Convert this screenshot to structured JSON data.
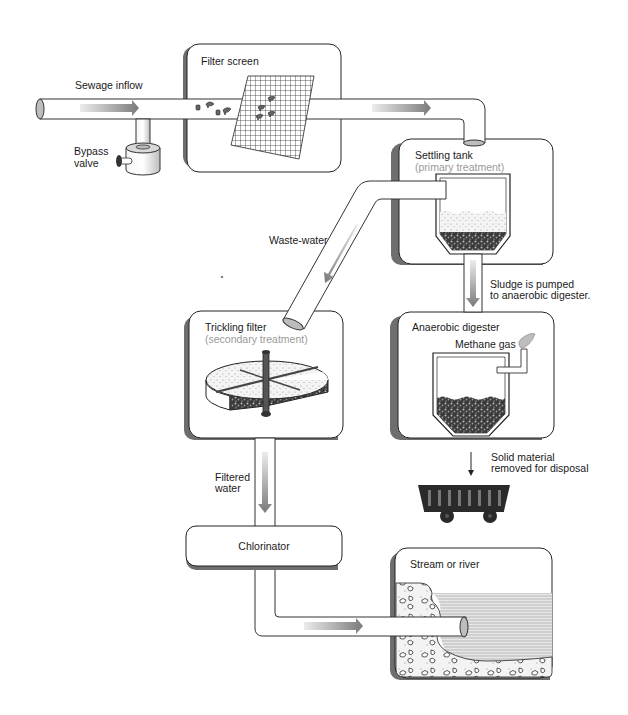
{
  "labels": {
    "sewage_inflow": "Sewage inflow",
    "bypass_valve_line1": "Bypass",
    "bypass_valve_line2": "valve",
    "filter_screen": "Filter screen",
    "settling_tank": "Settling tank",
    "settling_tank_sub": "(primary treatment)",
    "waste_water": "Waste-water",
    "sludge_line1": "Sludge is pumped",
    "sludge_line2": "to anaerobic digester.",
    "trickling_filter": "Trickling filter",
    "trickling_filter_sub": "(secondary treatment)",
    "anaerobic_digester": "Anaerobic digester",
    "methane_gas": "Methane gas",
    "solid_line1": "Solid material",
    "solid_line2": "removed for disposal",
    "filtered_line1": "Filtered",
    "filtered_line2": "water",
    "chlorinator": "Chlorinator",
    "stream_or_river": "Stream or river"
  },
  "colors": {
    "outline": "#222222",
    "panel_shadow": "#6e6e6e",
    "subtitle": "#9a9a9a",
    "arrow_dark": "#7a7a7a",
    "arrow_light": "#e6e6e6",
    "water": "#c8c8c8",
    "cart": "#2a2a2a"
  },
  "flow_sequence": [
    "Sewage inflow",
    "Filter screen",
    "Settling tank",
    "Trickling filter",
    "Chlorinator",
    "Stream or river"
  ],
  "sludge_sequence": [
    "Settling tank",
    "Anaerobic digester",
    "Solid material removed for disposal"
  ]
}
